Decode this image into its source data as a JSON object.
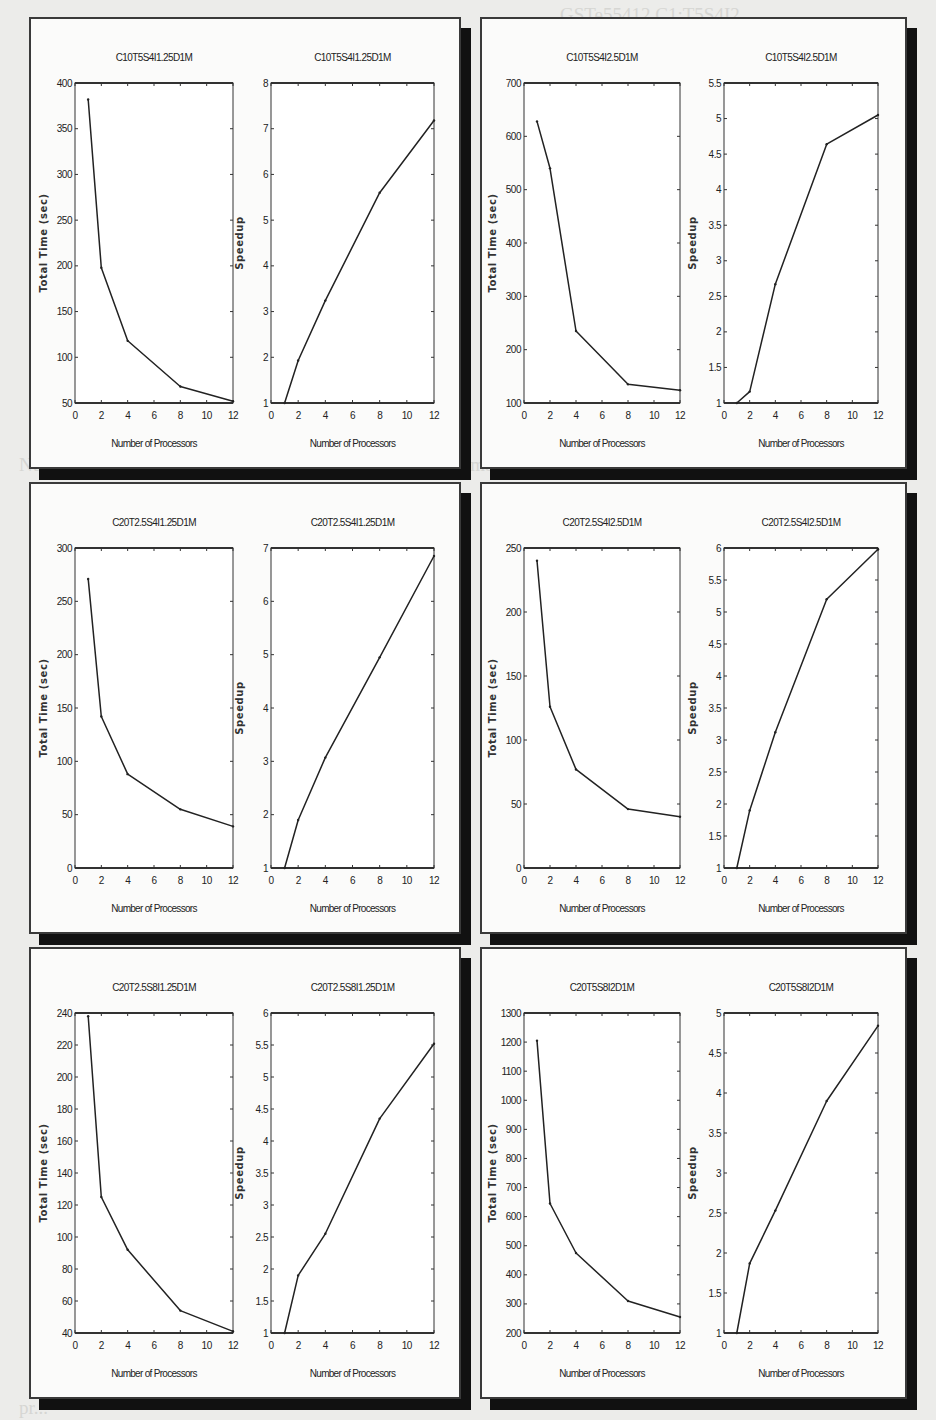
{
  "figure": {
    "background_text": [
      "Fig. 17  Speedup ...",
      "M... ..."
    ]
  },
  "chart_data": [
    {
      "type": "line",
      "panel": 1,
      "title": "C10T5S4I1.25D1M",
      "xlabel": "Number of Processors",
      "ylabel": "Total Time (sec)",
      "x": [
        1,
        2,
        4,
        8,
        12
      ],
      "values": [
        382,
        198,
        118,
        68,
        52
      ],
      "xlim": [
        0,
        12
      ],
      "ylim": [
        50,
        400
      ],
      "xticks": [
        0,
        2,
        4,
        6,
        8,
        10,
        12
      ],
      "yticks": [
        50,
        100,
        150,
        200,
        250,
        300,
        350,
        400
      ],
      "grid": false
    },
    {
      "type": "line",
      "panel": 1,
      "title": "C10T5S4I1.25D1M",
      "xlabel": "Number of Processors",
      "ylabel": "Speedup",
      "x": [
        1,
        2,
        4,
        8,
        12
      ],
      "values": [
        1,
        1.93,
        3.24,
        5.6,
        7.18
      ],
      "xlim": [
        0,
        12
      ],
      "ylim": [
        1,
        8
      ],
      "xticks": [
        0,
        2,
        4,
        6,
        8,
        10,
        12
      ],
      "yticks": [
        1,
        2,
        3,
        4,
        5,
        6,
        7,
        8
      ],
      "grid": false
    },
    {
      "type": "line",
      "panel": 2,
      "title": "C10T5S4I2.5D1M",
      "xlabel": "Number of Processors",
      "ylabel": "Total Time (sec)",
      "x": [
        1,
        2,
        4,
        8,
        12
      ],
      "values": [
        628,
        540,
        235,
        135,
        124
      ],
      "xlim": [
        0,
        12
      ],
      "ylim": [
        100,
        700
      ],
      "xticks": [
        0,
        2,
        4,
        6,
        8,
        10,
        12
      ],
      "yticks": [
        100,
        200,
        300,
        400,
        500,
        600,
        700
      ],
      "grid": false
    },
    {
      "type": "line",
      "panel": 2,
      "title": "C10T5S4I2.5D1M",
      "xlabel": "Number of Processors",
      "ylabel": "Speedup",
      "x": [
        1,
        2,
        4,
        8,
        12
      ],
      "values": [
        1,
        1.16,
        2.67,
        4.64,
        5.05
      ],
      "xlim": [
        0,
        12
      ],
      "ylim": [
        1,
        5.5
      ],
      "xticks": [
        0,
        2,
        4,
        6,
        8,
        10,
        12
      ],
      "yticks": [
        1,
        1.5,
        2,
        2.5,
        3,
        3.5,
        4,
        4.5,
        5,
        5.5
      ],
      "grid": false
    },
    {
      "type": "line",
      "panel": 3,
      "title": "C20T2.5S4I1.25D1M",
      "xlabel": "Number of Processors",
      "ylabel": "Total Time (sec)",
      "x": [
        1,
        2,
        4,
        8,
        12
      ],
      "values": [
        271,
        142,
        88,
        55,
        39
      ],
      "xlim": [
        0,
        12
      ],
      "ylim": [
        0,
        300
      ],
      "xticks": [
        0,
        2,
        4,
        6,
        8,
        10,
        12
      ],
      "yticks": [
        0,
        50,
        100,
        150,
        200,
        250,
        300
      ],
      "grid": false
    },
    {
      "type": "line",
      "panel": 3,
      "title": "C20T2.5S4I1.25D1M",
      "xlabel": "Number of Processors",
      "ylabel": "Speedup",
      "x": [
        1,
        2,
        4,
        8,
        12
      ],
      "values": [
        1,
        1.9,
        3.07,
        4.95,
        6.85
      ],
      "xlim": [
        0,
        12
      ],
      "ylim": [
        1,
        7
      ],
      "xticks": [
        0,
        2,
        4,
        6,
        8,
        10,
        12
      ],
      "yticks": [
        1,
        2,
        3,
        4,
        5,
        6,
        7
      ],
      "grid": false
    },
    {
      "type": "line",
      "panel": 4,
      "title": "C20T2.5S4I2.5D1M",
      "xlabel": "Number of Processors",
      "ylabel": "Total Time (sec)",
      "x": [
        1,
        2,
        4,
        8,
        12
      ],
      "values": [
        240,
        126,
        77,
        46,
        40
      ],
      "xlim": [
        0,
        12
      ],
      "ylim": [
        0,
        250
      ],
      "xticks": [
        0,
        2,
        4,
        6,
        8,
        10,
        12
      ],
      "yticks": [
        0,
        50,
        100,
        150,
        200,
        250
      ],
      "grid": false
    },
    {
      "type": "line",
      "panel": 4,
      "title": "C20T2.5S4I2.5D1M",
      "xlabel": "Number of Processors",
      "ylabel": "Speedup",
      "x": [
        1,
        2,
        4,
        8,
        12
      ],
      "values": [
        1,
        1.9,
        3.12,
        5.2,
        5.98
      ],
      "xlim": [
        0,
        12
      ],
      "ylim": [
        1,
        6
      ],
      "xticks": [
        0,
        2,
        4,
        6,
        8,
        10,
        12
      ],
      "yticks": [
        1,
        1.5,
        2,
        2.5,
        3,
        3.5,
        4,
        4.5,
        5,
        5.5,
        6
      ],
      "grid": false
    },
    {
      "type": "line",
      "panel": 5,
      "title": "C20T2.5S8I1.25D1M",
      "xlabel": "Number of Processors",
      "ylabel": "Total Time (sec)",
      "x": [
        1,
        2,
        4,
        8,
        12
      ],
      "values": [
        238,
        125,
        92,
        54,
        41
      ],
      "xlim": [
        0,
        12
      ],
      "ylim": [
        40,
        240
      ],
      "xticks": [
        0,
        2,
        4,
        6,
        8,
        10,
        12
      ],
      "yticks": [
        40,
        60,
        80,
        100,
        120,
        140,
        160,
        180,
        200,
        220,
        240
      ],
      "grid": false
    },
    {
      "type": "line",
      "panel": 5,
      "title": "C20T2.5S8I1.25D1M",
      "xlabel": "Number of Processors",
      "ylabel": "Speedup",
      "x": [
        1,
        2,
        4,
        8,
        12
      ],
      "values": [
        1,
        1.9,
        2.55,
        4.35,
        5.52
      ],
      "xlim": [
        0,
        12
      ],
      "ylim": [
        1,
        6
      ],
      "xticks": [
        0,
        2,
        4,
        6,
        8,
        10,
        12
      ],
      "yticks": [
        1,
        1.5,
        2,
        2.5,
        3,
        3.5,
        4,
        4.5,
        5,
        5.5,
        6
      ],
      "grid": false
    },
    {
      "type": "line",
      "panel": 6,
      "title": "C20T5S8I2D1M",
      "xlabel": "Number of Processors",
      "ylabel": "Total Time (sec)",
      "x": [
        1,
        2,
        4,
        8,
        12
      ],
      "values": [
        1205,
        645,
        475,
        310,
        255
      ],
      "xlim": [
        0,
        12
      ],
      "ylim": [
        200,
        1300
      ],
      "xticks": [
        0,
        2,
        4,
        6,
        8,
        10,
        12
      ],
      "yticks": [
        200,
        300,
        400,
        500,
        600,
        700,
        800,
        900,
        1000,
        1100,
        1200,
        1300
      ],
      "grid": false
    },
    {
      "type": "line",
      "panel": 6,
      "title": "C20T5S8I2D1M",
      "xlabel": "Number of Processors",
      "ylabel": "Speedup",
      "x": [
        1,
        2,
        4,
        8,
        12
      ],
      "values": [
        1,
        1.87,
        2.53,
        3.9,
        4.84
      ],
      "xlim": [
        0,
        12
      ],
      "ylim": [
        1,
        5
      ],
      "xticks": [
        0,
        2,
        4,
        6,
        8,
        10,
        12
      ],
      "yticks": [
        1,
        1.5,
        2,
        2.5,
        3,
        3.5,
        4,
        4.5,
        5
      ],
      "grid": false
    }
  ],
  "layout": {
    "panels": [
      {
        "left": 29,
        "top": 17,
        "width": 432,
        "height": 452
      },
      {
        "left": 480,
        "top": 17,
        "width": 427,
        "height": 452
      },
      {
        "left": 29,
        "top": 482,
        "width": 432,
        "height": 452
      },
      {
        "left": 480,
        "top": 482,
        "width": 427,
        "height": 452
      },
      {
        "left": 29,
        "top": 947,
        "width": 432,
        "height": 452
      },
      {
        "left": 480,
        "top": 947,
        "width": 427,
        "height": 452
      }
    ]
  }
}
